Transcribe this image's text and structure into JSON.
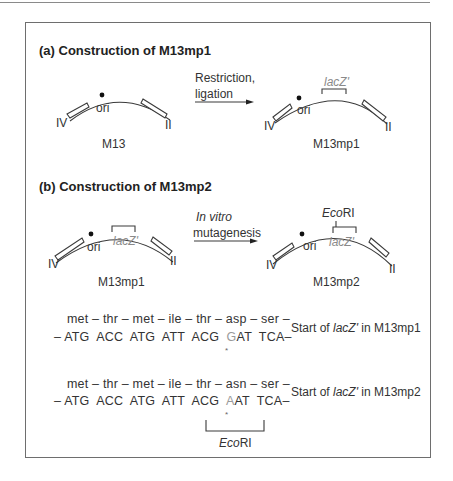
{
  "panel_a": {
    "heading": "(a)  Construction of M13mp1",
    "left_plasmid": {
      "name": "M13",
      "labels": {
        "gene_iv": "IV",
        "gene_ii": "II",
        "ori": "ori"
      }
    },
    "arrow": {
      "line1": "Restriction,",
      "line2": "ligation"
    },
    "right_plasmid": {
      "name": "M13mp1",
      "insert": "lacZ'",
      "labels": {
        "gene_iv": "IV",
        "gene_ii": "II",
        "ori": "ori"
      }
    }
  },
  "panel_b": {
    "heading": "(b)  Construction of M13mp2",
    "left_plasmid": {
      "name": "M13mp1",
      "insert": "lacZ'",
      "labels": {
        "gene_iv": "IV",
        "gene_ii": "II",
        "ori": "ori"
      }
    },
    "arrow": {
      "line1": "In vitro",
      "line2": "mutagenesis"
    },
    "right_plasmid": {
      "name": "M13mp2",
      "insert": "lacZ'",
      "site_italic": "Eco",
      "site_roman": "RI",
      "labels": {
        "gene_iv": "IV",
        "gene_ii": "II",
        "ori": "ori"
      }
    }
  },
  "sequences": [
    {
      "amino_acids": "met – thr – met – ile –  thr  – asp –  ser –",
      "codons_pre": "– ATG  ACC  ATG  ATT  ACG  ",
      "mutated_base": "G",
      "codons_post": "AT  TCA–",
      "marker": "*",
      "caption_pre": "Start of ",
      "caption_gene": "lacZ'",
      "caption_post": " in M13mp1"
    },
    {
      "amino_acids": "met – thr – met – ile –  thr  – asn –  ser –",
      "codons_pre": "– ATG  ACC  ATG  ATT  ACG  ",
      "mutated_base": "A",
      "codons_post": "AT  TCA–",
      "marker": "*",
      "caption_pre": "Start of ",
      "caption_gene": "lacZ'",
      "caption_post": " in M13mp2"
    }
  ],
  "restriction_site": {
    "italic": "Eco",
    "roman": "RI"
  }
}
